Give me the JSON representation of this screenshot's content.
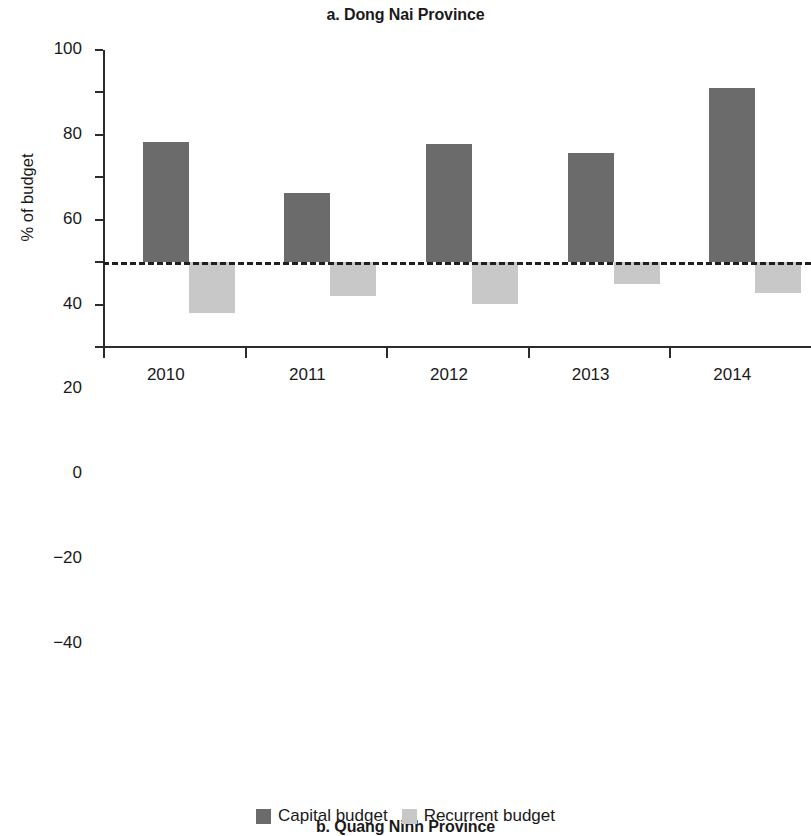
{
  "ylabel_a": "% of budget",
  "ylabel_b": "% of budget",
  "legend": {
    "items": [
      {
        "label": "Capital budget",
        "color": "#6b6b6b",
        "key": "capital"
      },
      {
        "label": "Recurrent budget",
        "color": "#c8c8c8",
        "key": "recurrent"
      }
    ]
  },
  "chart_data": [
    {
      "type": "bar",
      "id": "dong-nai",
      "title": "a. Dong Nai Province",
      "xlabel": "",
      "ylabel": "% of budget",
      "categories": [
        "2010",
        "2011",
        "2012",
        "2013",
        "2014"
      ],
      "yticks": [
        -40,
        -20,
        0,
        20,
        40,
        60,
        80,
        100
      ],
      "yticklabels": [
        "−40",
        "−20",
        "0",
        "20",
        "40",
        "60",
        "80",
        "100"
      ],
      "ylim": [
        -40,
        100
      ],
      "grid": false,
      "zero_line": true,
      "zero_line_style": "dashed",
      "legend_position": "below-figure",
      "series": [
        {
          "name": "Capital budget",
          "key": "capital",
          "color": "#6b6b6b",
          "values": [
            56.8,
            32.5,
            55.6,
            51.6,
            82.0
          ]
        },
        {
          "name": "Recurrent budget",
          "key": "recurrent",
          "color": "#c8c8c8",
          "values": [
            -24.2,
            -15.8,
            -19.6,
            -10.5,
            -14.6
          ]
        }
      ]
    },
    {
      "type": "bar",
      "id": "quang-ninh",
      "title": "b. Quang Ninh Province",
      "xlabel": "",
      "ylabel": "% of budget",
      "categories": [
        "2012",
        "2013",
        "2014"
      ],
      "yticks": [
        0,
        10,
        20,
        30,
        40,
        50,
        60
      ],
      "yticklabels": [
        "0",
        "10",
        "20",
        "30",
        "40",
        "50",
        "60"
      ],
      "ylim": [
        0,
        60
      ],
      "grid": false,
      "zero_line": false,
      "legend_position": "below-figure",
      "series": [
        {
          "name": "Capital budget",
          "key": "capital",
          "color": "#6b6b6b",
          "values": [
            42.6,
            50.3,
            19.3
          ]
        },
        {
          "name": "Recurrent budget",
          "key": "recurrent",
          "color": "#c8c8c8",
          "values": [
            5.7,
            7.0,
            4.6
          ]
        }
      ]
    }
  ]
}
